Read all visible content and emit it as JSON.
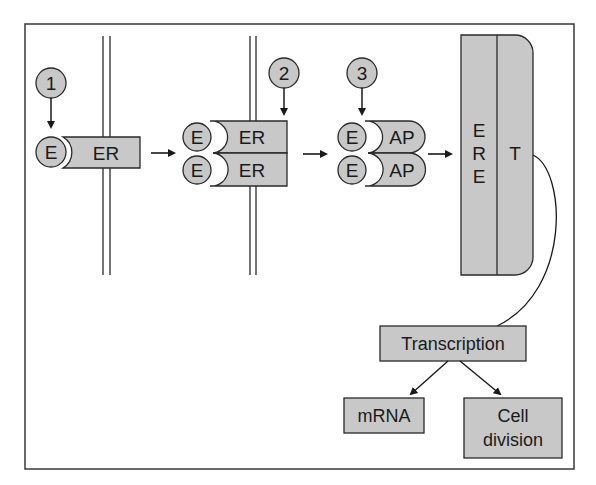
{
  "diagram": {
    "title": "",
    "colors": {
      "fill": "#c8c8c8",
      "stroke": "#2a2a2a",
      "frame": "#3a3a3a",
      "background": "#ffffff"
    },
    "steps": [
      {
        "id": "step-1",
        "label": "1"
      },
      {
        "id": "step-2",
        "label": "2"
      },
      {
        "id": "step-3",
        "label": "3"
      }
    ],
    "stage1": {
      "ligand": "E",
      "receptor": "ER"
    },
    "stage2": {
      "ligands": [
        "E",
        "E"
      ],
      "receptors": [
        "ER",
        "ER"
      ]
    },
    "stage3": {
      "ligands": [
        "E",
        "E"
      ],
      "proteins": [
        "AP",
        "AP"
      ]
    },
    "dna": {
      "element_letters": [
        "E",
        "R",
        "E"
      ],
      "target": "T"
    },
    "outcomes": {
      "transcription": "Transcription",
      "mrna": "mRNA",
      "cell_division_line1": "Cell",
      "cell_division_line2": "division"
    }
  }
}
